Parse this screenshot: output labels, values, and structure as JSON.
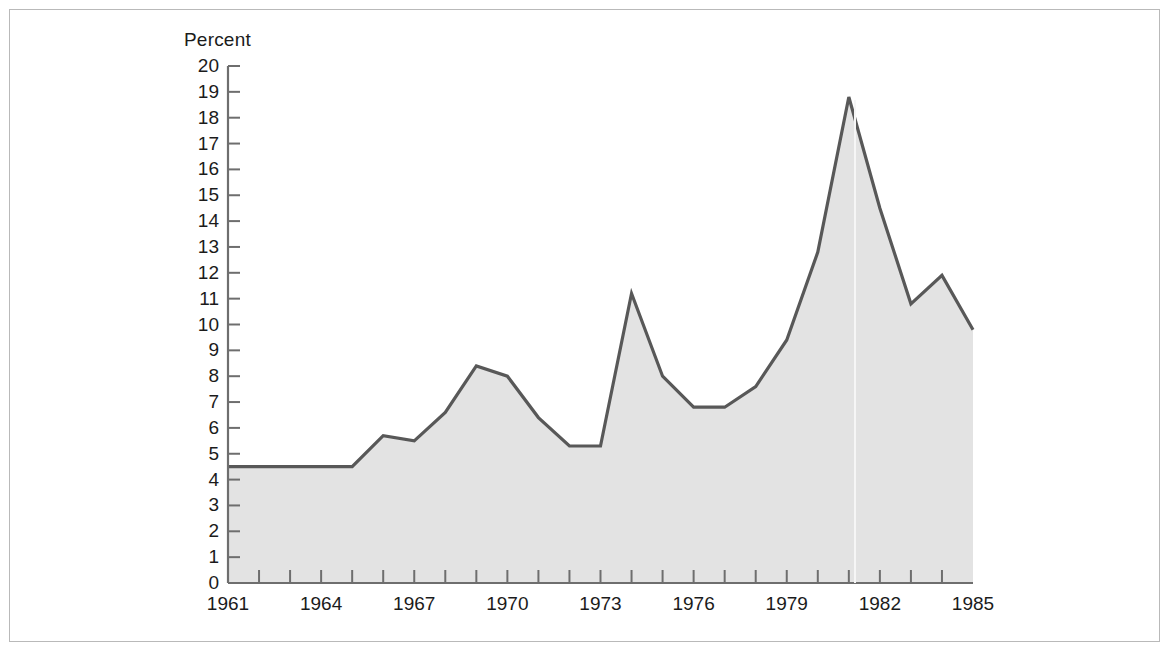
{
  "figure": {
    "background_color": "#ffffff",
    "frame_color": "#b9b9b9"
  },
  "chart_data": {
    "type": "area",
    "title": "",
    "subtitle": "",
    "xlabel": "",
    "ylabel": "Percent",
    "ylim": [
      0,
      20
    ],
    "xlim": [
      1961,
      1985
    ],
    "grid": false,
    "legend": null,
    "line_color": "#585858",
    "fill_color": "#e3e3e3",
    "ytick_labels": [
      "20",
      "19",
      "18",
      "17",
      "16",
      "15",
      "14",
      "13",
      "12",
      "11",
      "10",
      "9",
      "8",
      "7",
      "6",
      "5",
      "4",
      "3",
      "2",
      "1",
      "0"
    ],
    "yticks": [
      20,
      19,
      18,
      17,
      16,
      15,
      14,
      13,
      12,
      11,
      10,
      9,
      8,
      7,
      6,
      5,
      4,
      3,
      2,
      1,
      0
    ],
    "xtick_labels": [
      "1961",
      "1964",
      "1967",
      "1970",
      "1973",
      "1976",
      "1979",
      "1982",
      "1985"
    ],
    "xticks_labeled": [
      1961,
      1964,
      1967,
      1970,
      1973,
      1976,
      1979,
      1982,
      1985
    ],
    "xticks_minor": [
      1962,
      1963,
      1965,
      1966,
      1968,
      1969,
      1971,
      1972,
      1974,
      1975,
      1977,
      1978,
      1980,
      1981,
      1983,
      1984
    ],
    "x": [
      1961,
      1962,
      1963,
      1964,
      1965,
      1966,
      1967,
      1968,
      1969,
      1970,
      1971,
      1972,
      1973,
      1974,
      1975,
      1976,
      1977,
      1978,
      1979,
      1980,
      1981,
      1982,
      1983,
      1984,
      1985
    ],
    "values": [
      4.5,
      4.5,
      4.5,
      4.5,
      4.5,
      5.7,
      5.5,
      6.6,
      8.4,
      8.0,
      6.4,
      5.3,
      5.3,
      11.2,
      8.0,
      6.8,
      6.8,
      7.6,
      9.4,
      12.8,
      18.8,
      14.5,
      10.8,
      11.9,
      9.8
    ],
    "series_name": ""
  }
}
